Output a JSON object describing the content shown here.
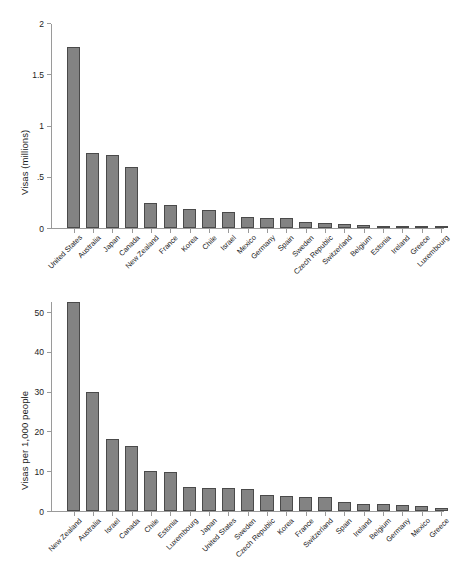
{
  "figure": {
    "background_color": "#ffffff",
    "bar_color": "#838383",
    "bar_edge_color": "#4a4a4a",
    "axis_color": "#9a9a9a",
    "text_color": "#1c1c1c"
  },
  "chart_data": [
    {
      "type": "bar",
      "panel": "top",
      "title": "",
      "subtitle": "",
      "xlabel": "",
      "ylabel": "Visas (millions)",
      "ylim": [
        0,
        2
      ],
      "yticks": [
        0,
        0.5,
        1,
        1.5,
        2
      ],
      "ytick_labels": [
        "0",
        ".5",
        "1",
        "1.5",
        "2"
      ],
      "grid": false,
      "legend": null,
      "categories": [
        "United States",
        "Australia",
        "Japan",
        "Canada",
        "New Zealand",
        "France",
        "Korea",
        "Chile",
        "Israel",
        "Mexico",
        "Germany",
        "Spain",
        "Sweden",
        "Czech Republic",
        "Switzerland",
        "Belgium",
        "Estonia",
        "Ireland",
        "Greece",
        "Luxembourg"
      ],
      "values": [
        1.77,
        0.73,
        0.715,
        0.595,
        0.245,
        0.22,
        0.185,
        0.18,
        0.155,
        0.105,
        0.1,
        0.1,
        0.06,
        0.05,
        0.035,
        0.025,
        0.02,
        0.008,
        0.005,
        0.004
      ]
    },
    {
      "type": "bar",
      "panel": "bottom",
      "title": "",
      "subtitle": "",
      "xlabel": "",
      "ylabel": "Visas per 1,000 people",
      "ylim": [
        0,
        52.8
      ],
      "yticks": [
        0,
        10,
        20,
        30,
        40,
        50
      ],
      "ytick_labels": [
        "0",
        "10",
        "20",
        "30",
        "40",
        "50"
      ],
      "grid": false,
      "legend": null,
      "categories": [
        "New Zealand",
        "Australia",
        "Israel",
        "Canada",
        "Chile",
        "Estonia",
        "Luxembourg",
        "Japan",
        "United States",
        "Sweden",
        "Czech Republic",
        "Korea",
        "France",
        "Switzerland",
        "Spain",
        "Ireland",
        "Belgium",
        "Germany",
        "Mexico",
        "Greece"
      ],
      "values": [
        52.6,
        30.0,
        18.1,
        16.4,
        10.1,
        9.9,
        6.0,
        5.9,
        5.8,
        5.6,
        4.1,
        3.9,
        3.5,
        3.4,
        2.3,
        1.8,
        1.8,
        1.5,
        1.2,
        0.8
      ]
    }
  ]
}
